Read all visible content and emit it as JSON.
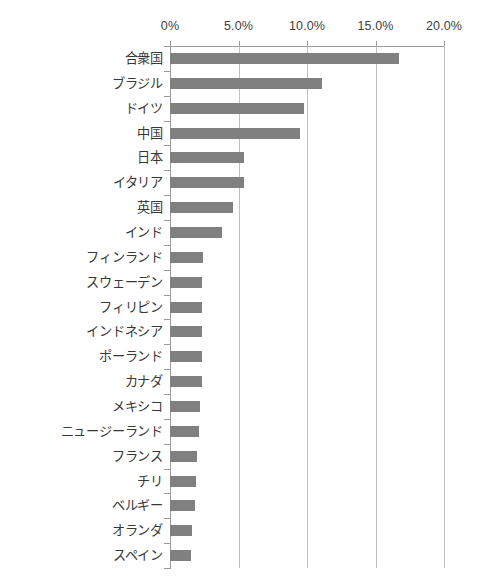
{
  "chart_data": {
    "type": "bar",
    "orientation": "horizontal",
    "title": "",
    "subtitle": "",
    "xlabel": "",
    "ylabel": "",
    "xlim": [
      0,
      20
    ],
    "ylim": null,
    "grid": true,
    "legend": null,
    "legend_position": "none",
    "axis_position": "top",
    "value_suffix": "%",
    "tick_labels": [
      "0%",
      "5.0%",
      "10.0%",
      "15.0%",
      "20.0%"
    ],
    "tick_values": [
      0,
      5,
      10,
      15,
      20
    ],
    "categories": [
      "合衆国",
      "ブラジル",
      "ドイツ",
      "中国",
      "日本",
      "イタリア",
      "英国",
      "インド",
      "フィンランド",
      "スウェーデン",
      "フィリピン",
      "インドネシア",
      "ポーランド",
      "カナダ",
      "メキシコ",
      "ニュージーランド",
      "フランス",
      "チリ",
      "ベルギー",
      "オランダ",
      "スペイン"
    ],
    "values": [
      16.7,
      11.1,
      9.8,
      9.5,
      5.4,
      5.4,
      4.6,
      3.8,
      2.4,
      2.3,
      2.3,
      2.3,
      2.3,
      2.3,
      2.2,
      2.1,
      2.0,
      1.9,
      1.8,
      1.6,
      1.5
    ]
  },
  "style": {
    "bar_color": "#808080",
    "gridline_color": "#bfbfbf",
    "axis_color": "#9a9a9a",
    "text_color": "#3a3a3a",
    "background": "#ffffff"
  }
}
